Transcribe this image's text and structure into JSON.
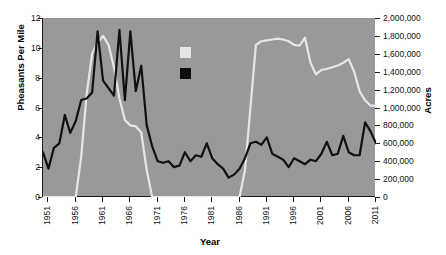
{
  "chart_data": {
    "type": "line",
    "title": "",
    "xlabel": "Year",
    "ylabel": "Pheasants Per Mile",
    "y2label": "Acres",
    "xlim": [
      1950,
      2011
    ],
    "ylim": [
      0,
      12
    ],
    "y2lim": [
      0,
      2000000
    ],
    "grid": false,
    "legend_position": "inside-top-left",
    "background_color": "#999999",
    "xticks": [
      "1951",
      "1956",
      "1961",
      "1966",
      "1971",
      "1976",
      "1981",
      "1986",
      "1991",
      "1996",
      "2001",
      "2006",
      "2011"
    ],
    "xtick_values": [
      1951,
      1956,
      1961,
      1966,
      1971,
      1976,
      1981,
      1986,
      1991,
      1996,
      2001,
      2006,
      2011
    ],
    "yticks": [
      "0",
      "2",
      "4",
      "6",
      "8",
      "10",
      "12"
    ],
    "ytick_values": [
      0,
      2,
      4,
      6,
      8,
      10,
      12
    ],
    "y2ticks": [
      "0",
      "200,000",
      "400,000",
      "600,000",
      "800,000",
      "1,000,000",
      "1,200,000",
      "1,400,000",
      "1,600,000",
      "1,800,000",
      "2,000,000"
    ],
    "y2tick_values": [
      0,
      200000,
      400000,
      600000,
      800000,
      1000000,
      1200000,
      1400000,
      1600000,
      1800000,
      2000000
    ],
    "x": [
      1950,
      1951,
      1952,
      1953,
      1954,
      1955,
      1956,
      1957,
      1958,
      1959,
      1960,
      1961,
      1962,
      1963,
      1964,
      1965,
      1966,
      1967,
      1968,
      1969,
      1970,
      1971,
      1972,
      1973,
      1974,
      1975,
      1976,
      1977,
      1978,
      1979,
      1980,
      1981,
      1982,
      1983,
      1984,
      1985,
      1986,
      1987,
      1988,
      1989,
      1990,
      1991,
      1992,
      1993,
      1994,
      1995,
      1996,
      1997,
      1998,
      1999,
      2000,
      2001,
      2002,
      2003,
      2004,
      2005,
      2006,
      2007,
      2008,
      2009,
      2010,
      2011
    ],
    "series": [
      {
        "name": "Pheasants Per Mile",
        "axis": "left",
        "color": "#111111",
        "values": [
          3.0,
          1.9,
          3.3,
          3.6,
          5.5,
          4.3,
          5.1,
          6.5,
          6.6,
          7.0,
          11.1,
          7.8,
          7.3,
          6.8,
          11.2,
          6.5,
          11.1,
          7.1,
          8.8,
          4.8,
          3.4,
          2.4,
          2.3,
          2.4,
          2.0,
          2.1,
          3.0,
          2.4,
          2.8,
          2.7,
          3.6,
          2.6,
          2.2,
          1.9,
          1.3,
          1.5,
          1.9,
          2.6,
          3.6,
          3.7,
          3.5,
          4.0,
          2.9,
          2.7,
          2.5,
          2.0,
          2.6,
          2.4,
          2.2,
          2.5,
          2.4,
          2.9,
          3.7,
          2.8,
          2.9,
          4.1,
          3.0,
          2.8,
          2.8,
          5.0,
          4.4,
          3.6
        ]
      },
      {
        "name": "Acres",
        "axis": "right",
        "color": "#e6e6e6",
        "values": [
          0,
          0,
          0,
          0,
          0,
          0,
          0,
          450000,
          1150000,
          1600000,
          1720000,
          1800000,
          1700000,
          1450000,
          1100000,
          860000,
          800000,
          790000,
          720000,
          300000,
          0,
          0,
          0,
          0,
          0,
          0,
          0,
          0,
          0,
          0,
          0,
          0,
          0,
          0,
          0,
          0,
          0,
          300000,
          1000000,
          1700000,
          1740000,
          1750000,
          1760000,
          1770000,
          1760000,
          1740000,
          1700000,
          1690000,
          1780000,
          1500000,
          1370000,
          1420000,
          1430000,
          1450000,
          1470000,
          1500000,
          1540000,
          1400000,
          1180000,
          1080000,
          1020000,
          1020000
        ]
      }
    ]
  },
  "legend": {
    "items": [
      {
        "swatch_color": "#e6e6e6",
        "label": "",
        "name": "acres-swatch"
      },
      {
        "swatch_color": "#0d0d0d",
        "label": "",
        "name": "pheasants-swatch"
      }
    ]
  }
}
